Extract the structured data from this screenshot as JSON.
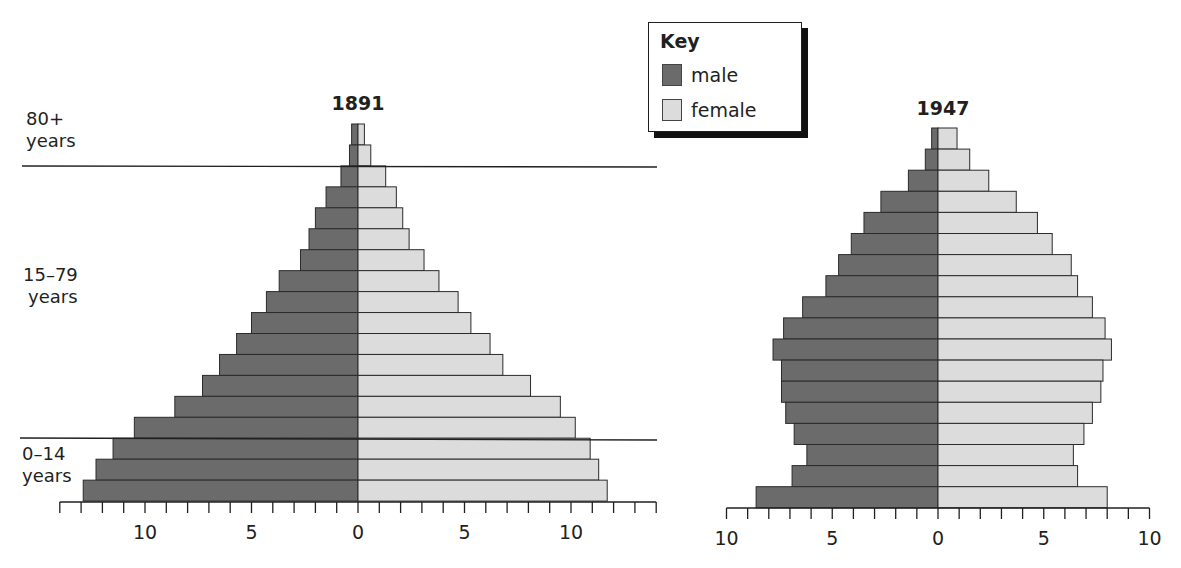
{
  "legend": {
    "title": "Key",
    "items": [
      {
        "label": "male",
        "color": "#6b6b6b"
      },
      {
        "label": "female",
        "color": "#dcdcdc"
      }
    ]
  },
  "age_bands": [
    {
      "line1": "80+",
      "line2": "years"
    },
    {
      "line1": "15–79",
      "line2": "years"
    },
    {
      "line1": "0–14",
      "line2": "years"
    }
  ],
  "chart_data": [
    {
      "type": "bar",
      "subtype": "population-pyramid",
      "title": "1891",
      "categories_top_to_bottom": [
        "85+",
        "80–84",
        "75–79",
        "70–74",
        "65–69",
        "60–64",
        "55–59",
        "50–54",
        "45–49",
        "40–44",
        "35–39",
        "30–34",
        "25–29",
        "20–24",
        "15–19",
        "10–14",
        "5–9",
        "0–4"
      ],
      "series": [
        {
          "name": "male",
          "color": "#6b6b6b",
          "values": [
            0.3,
            0.4,
            0.8,
            1.5,
            2.0,
            2.3,
            2.7,
            3.7,
            4.3,
            5.0,
            5.7,
            6.5,
            7.3,
            8.6,
            10.5,
            11.5,
            12.3,
            12.9
          ]
        },
        {
          "name": "female",
          "color": "#dcdcdc",
          "values": [
            0.3,
            0.6,
            1.3,
            1.8,
            2.1,
            2.4,
            3.1,
            3.8,
            4.7,
            5.3,
            6.2,
            6.8,
            8.1,
            9.5,
            10.2,
            10.9,
            11.3,
            11.7
          ]
        }
      ],
      "xlim": [
        -14,
        14
      ],
      "xticks": [
        10,
        5,
        0,
        5,
        10
      ],
      "xlabel": "",
      "ylabel": "",
      "band_separators": [
        "80+ / 15–79",
        "15–79 / 0–14"
      ]
    },
    {
      "type": "bar",
      "subtype": "population-pyramid",
      "title": "1947",
      "categories_top_to_bottom": [
        "85+",
        "80–84",
        "75–79",
        "70–74",
        "65–69",
        "60–64",
        "55–59",
        "50–54",
        "45–49",
        "40–44",
        "35–39",
        "30–34",
        "25–29",
        "20–24",
        "15–19",
        "10–14",
        "5–9",
        "0–4"
      ],
      "series": [
        {
          "name": "male",
          "color": "#6b6b6b",
          "values": [
            0.3,
            0.6,
            1.4,
            2.7,
            3.5,
            4.1,
            4.7,
            5.3,
            6.4,
            7.3,
            7.8,
            7.4,
            7.4,
            7.2,
            6.8,
            6.2,
            6.9,
            8.6
          ]
        },
        {
          "name": "female",
          "color": "#dcdcdc",
          "values": [
            0.9,
            1.5,
            2.4,
            3.7,
            4.7,
            5.4,
            6.3,
            6.6,
            7.3,
            7.9,
            8.2,
            7.8,
            7.7,
            7.3,
            6.9,
            6.4,
            6.6,
            8.0
          ]
        }
      ],
      "xlim": [
        -10,
        10
      ],
      "xticks": [
        10,
        5,
        0,
        5,
        10
      ],
      "xlabel": "",
      "ylabel": ""
    }
  ]
}
